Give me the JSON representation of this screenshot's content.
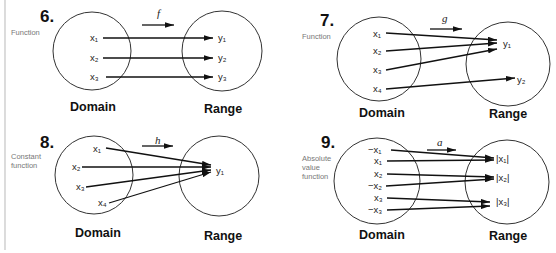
{
  "layout": {
    "left_rule_color": "#bdbdbd"
  },
  "diagrams": [
    {
      "number": "6.",
      "side_label": [
        "Function"
      ],
      "function_name": "f",
      "domain_label": "Domain",
      "range_label": "Range",
      "domain": [
        "x₁",
        "x₂",
        "x₃"
      ],
      "range": [
        "y₁",
        "y₂",
        "y₃"
      ],
      "mapping": [
        [
          "x₁",
          "y₁"
        ],
        [
          "x₂",
          "y₂"
        ],
        [
          "x₃",
          "y₃"
        ]
      ]
    },
    {
      "number": "7.",
      "side_label": [
        "Function"
      ],
      "function_name": "g",
      "domain_label": "Domain",
      "range_label": "Range",
      "domain": [
        "x₁",
        "x₂",
        "x₃",
        "x₄"
      ],
      "range": [
        "y₁",
        "y₂"
      ],
      "mapping": [
        [
          "x₁",
          "y₁"
        ],
        [
          "x₂",
          "y₁"
        ],
        [
          "x₃",
          "y₁"
        ],
        [
          "x₄",
          "y₂"
        ]
      ]
    },
    {
      "number": "8.",
      "side_label": [
        "Constant",
        "function"
      ],
      "function_name": "h",
      "domain_label": "Domain",
      "range_label": "Range",
      "domain": [
        "x₁",
        "x₂",
        "x₃",
        "x₄"
      ],
      "range": [
        "y₁"
      ],
      "mapping": [
        [
          "x₁",
          "y₁"
        ],
        [
          "x₂",
          "y₁"
        ],
        [
          "x₃",
          "y₁"
        ],
        [
          "x₄",
          "y₁"
        ]
      ]
    },
    {
      "number": "9.",
      "side_label": [
        "Absolute",
        "value",
        "function"
      ],
      "function_name": "a",
      "domain_label": "Domain",
      "range_label": "Range",
      "domain": [
        "−x₁",
        "x₁",
        "x₂",
        "−x₂",
        "x₃",
        "−x₃"
      ],
      "range": [
        "|x₁|",
        "|x₂|",
        "|x₃|"
      ],
      "mapping": [
        [
          "−x₁",
          "|x₁|"
        ],
        [
          "x₁",
          "|x₁|"
        ],
        [
          "x₂",
          "|x₂|"
        ],
        [
          "−x₂",
          "|x₂|"
        ],
        [
          "x₃",
          "|x₃|"
        ],
        [
          "−x₃",
          "|x₃|"
        ]
      ]
    }
  ]
}
